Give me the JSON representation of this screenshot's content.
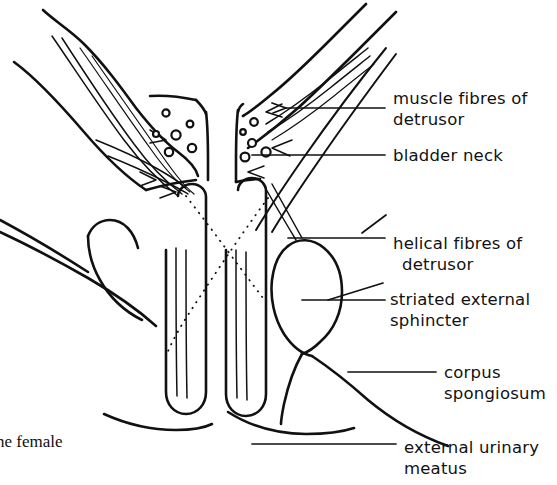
{
  "figure": {
    "kind": "anatomical-line-drawing",
    "background_color": "#ffffff",
    "ink_color": "#111111",
    "width": 557,
    "height": 485
  },
  "labels": [
    {
      "id": "muscle-fibres-of-detrusor",
      "line1": "muscle fibres of",
      "line2": "detrusor",
      "x": 393,
      "y": 88
    },
    {
      "id": "bladder-neck",
      "line1": "bladder neck",
      "line2": "",
      "x": 393,
      "y": 145
    },
    {
      "id": "helical-fibres-of-detrusor",
      "line1": "helical fibres of",
      "line2": "detrusor",
      "x": 393,
      "y": 233
    },
    {
      "id": "striated-external-sphincter",
      "line1": "striated external",
      "line2": "sphincter",
      "x": 390,
      "y": 289
    },
    {
      "id": "corpus-spongiosum",
      "line1": "corpus",
      "line2": "spongiosum",
      "x": 444,
      "y": 362
    },
    {
      "id": "external-urinary-meatus",
      "line1": "external urinary",
      "line2": "meatus",
      "x": 404,
      "y": 437
    }
  ],
  "caption_fragment": {
    "text": "ne female",
    "x": 0,
    "y": 432,
    "note": "partially cropped running caption at lower-left edge"
  },
  "fibre_circles": {
    "left_wall_count": 6,
    "right_wall_count": 5,
    "description": "small open circles depicting cross-sectioned muscle fibres"
  },
  "dotted_guides": {
    "count": 2,
    "description": "two crossing dotted lines spanning the urethral lumen"
  }
}
